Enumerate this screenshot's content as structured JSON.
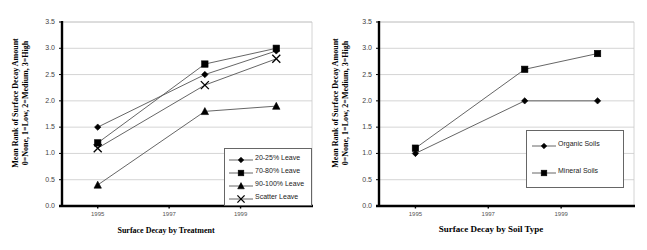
{
  "figure": {
    "panel_count": 2,
    "background": "#ffffff",
    "axis_color": "#000000",
    "gridline_color": "#c9c9c9",
    "series_line_color": "#555555",
    "marker_color": "#000000"
  },
  "chart_data": [
    {
      "type": "line",
      "title": "",
      "xlabel": "Surface Decay by Treatment",
      "ylabel": "Mean Rank of Surface Decay Amount 0=None, 1=Low, 2=Medium, 3=High",
      "ylabel_line1": "Mean Rank of Surface Decay Amount",
      "ylabel_line2": "0=None, 1=Low, 2=Medium, 3=High",
      "x": [
        1995,
        1998,
        2000
      ],
      "xtick_labels": [
        "1995",
        "1997",
        "1999"
      ],
      "xtick_values": [
        1995,
        1997,
        1999
      ],
      "xlim": [
        1994,
        2001
      ],
      "ylim": [
        0.0,
        3.5
      ],
      "ytick_labels": [
        "0.0",
        "0.5",
        "1.0",
        "1.5",
        "2.0",
        "2.5",
        "3.0",
        "3.5"
      ],
      "ytick_values": [
        0.0,
        0.5,
        1.0,
        1.5,
        2.0,
        2.5,
        3.0,
        3.5
      ],
      "grid": "horizontal",
      "legend_position": "bottom-right",
      "series": [
        {
          "name": "20-25% Leave",
          "marker": "diamond",
          "values": [
            1.5,
            2.5,
            2.95
          ]
        },
        {
          "name": "70-80% Leave",
          "marker": "square",
          "values": [
            1.2,
            2.7,
            3.0
          ]
        },
        {
          "name": "90-100% Leave",
          "marker": "triangle",
          "values": [
            0.4,
            1.8,
            1.9
          ]
        },
        {
          "name": "Scatter Leave",
          "marker": "x",
          "values": [
            1.1,
            2.3,
            2.8
          ]
        }
      ]
    },
    {
      "type": "line",
      "title": "",
      "xlabel": "Surface Decay by Soil Type",
      "ylabel": "Mean Rank of Surface Decay Amount 0=None, 1=Low, 2=Medium, 3=High",
      "ylabel_line1": "Mean Rank of Surface Decay Amount",
      "ylabel_line2": "0=None, 1=Low, 2=Medium, 3=High",
      "x": [
        1995,
        1998,
        2000
      ],
      "xtick_labels": [
        "1995",
        "1997",
        "1999"
      ],
      "xtick_values": [
        1995,
        1997,
        1999
      ],
      "xlim": [
        1994,
        2001
      ],
      "ylim": [
        0.0,
        3.5
      ],
      "ytick_labels": [
        "0.0",
        "0.5",
        "1.0",
        "1.5",
        "2.0",
        "2.5",
        "3.0",
        "3.5"
      ],
      "ytick_values": [
        0.0,
        0.5,
        1.0,
        1.5,
        2.0,
        2.5,
        3.0,
        3.5
      ],
      "grid": "horizontal",
      "legend_position": "middle-right",
      "series": [
        {
          "name": "Organic Soils",
          "marker": "diamond",
          "values": [
            1.0,
            2.0,
            2.0
          ]
        },
        {
          "name": "Mineral Soils",
          "marker": "square",
          "values": [
            1.1,
            2.6,
            2.9
          ]
        }
      ]
    }
  ]
}
